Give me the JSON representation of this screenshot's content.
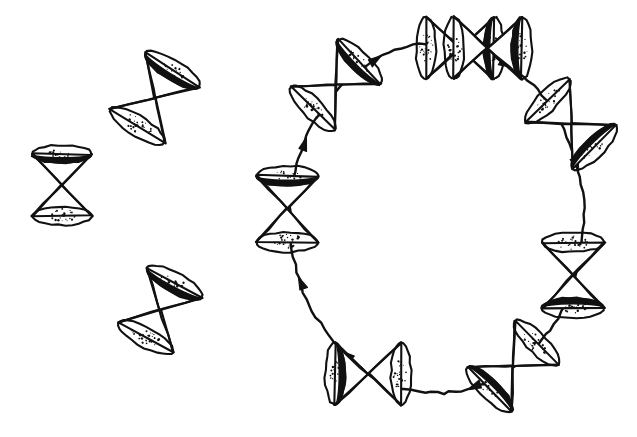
{
  "figure": {
    "title": "Light cones tipping over around a closed timelike curve",
    "medium": "hand-drawn ink line drawing",
    "background_color": "#ffffff",
    "ink_color": "#111111",
    "width": 637,
    "height": 437,
    "caption": ""
  },
  "chart_data": {
    "type": "diagram",
    "title": "Light cones tipping over around a closed timelike curve",
    "xlabel": "",
    "ylabel": "",
    "grid": false,
    "legend": "none",
    "xlim": [
      0,
      637
    ],
    "ylim": [
      0,
      437
    ],
    "ring": {
      "center_x": 437,
      "center_y": 218,
      "radius_x": 147,
      "radius_y": 175,
      "direction": "clockwise",
      "cone_count": 8,
      "arrow_count": 8,
      "rotation_per_step_deg": 45
    },
    "cones": [
      {
        "id": "free-cone-1",
        "label": "upright light cone",
        "cx": 62,
        "cy": 185,
        "rotation_deg": 0,
        "height": 62,
        "rim_rx": 30,
        "rim_ry": 9,
        "group": "isolated"
      },
      {
        "id": "free-cone-2",
        "label": "tilted light cone (upper)",
        "cx": 155,
        "cy": 98,
        "rotation_deg": 32,
        "height": 66,
        "rim_rx": 32,
        "rim_ry": 10,
        "group": "isolated"
      },
      {
        "id": "free-cone-3",
        "label": "tilted light cone (lower)",
        "cx": 160,
        "cy": 310,
        "rotation_deg": 28,
        "height": 62,
        "rim_rx": 31,
        "rim_ry": 10,
        "group": "isolated"
      },
      {
        "id": "ring-cone-1",
        "label": "ring cone at 12 o'clock",
        "cx": 460,
        "cy": 48,
        "rotation_deg": 90,
        "height": 68,
        "rim_rx": 31,
        "rim_ry": 10,
        "group": "ring",
        "angle_deg": -90
      },
      {
        "id": "ring-cone-2",
        "label": "ring cone at 1:30",
        "cx": 571,
        "cy": 124,
        "rotation_deg": 135,
        "height": 66,
        "rim_rx": 31,
        "rim_ry": 10,
        "group": "ring",
        "angle_deg": -45
      },
      {
        "id": "ring-cone-3",
        "label": "ring cone at 3 o'clock",
        "cx": 573,
        "cy": 275,
        "rotation_deg": 180,
        "height": 66,
        "rim_rx": 31,
        "rim_ry": 10,
        "group": "ring",
        "angle_deg": 0
      },
      {
        "id": "ring-cone-4",
        "label": "ring cone at 4:30",
        "cx": 513,
        "cy": 366,
        "rotation_deg": 225,
        "height": 66,
        "rim_rx": 31,
        "rim_ry": 10,
        "group": "ring",
        "angle_deg": 45
      },
      {
        "id": "ring-cone-5",
        "label": "ring cone at 6 o'clock",
        "cx": 368,
        "cy": 374,
        "rotation_deg": 270,
        "height": 66,
        "rim_rx": 31,
        "rim_ry": 10,
        "group": "ring",
        "angle_deg": 90
      },
      {
        "id": "ring-cone-6",
        "label": "ring cone at 9 o'clock",
        "cx": 287,
        "cy": 209,
        "rotation_deg": 0,
        "height": 66,
        "rim_rx": 31,
        "rim_ry": 10,
        "group": "ring",
        "angle_deg": 180
      },
      {
        "id": "ring-cone-7",
        "label": "ring cone at 10:30",
        "cx": 336,
        "cy": 85,
        "rotation_deg": 45,
        "height": 66,
        "rim_rx": 31,
        "rim_ry": 10,
        "group": "ring",
        "angle_deg": -135
      },
      {
        "id": "ring-cone-8",
        "label": "ring cone at 12:30",
        "cx": 460,
        "cy": 48,
        "rotation_deg": 90,
        "height": 68,
        "rim_rx": 31,
        "rim_ry": 10,
        "group": "ring",
        "angle_deg": -85
      }
    ],
    "arrows": [
      {
        "id": "arrow-1",
        "label": "clockwise arrow top-left",
        "at_angle_deg": -115,
        "points": "right"
      },
      {
        "id": "arrow-2",
        "label": "clockwise arrow top-right",
        "at_angle_deg": -62,
        "points": "down-right"
      },
      {
        "id": "arrow-3",
        "label": "clockwise arrow right-upper",
        "at_angle_deg": -18,
        "points": "down"
      },
      {
        "id": "arrow-4",
        "label": "clockwise arrow right-lower",
        "at_angle_deg": 28,
        "points": "down-left"
      },
      {
        "id": "arrow-5",
        "label": "clockwise arrow bottom",
        "at_angle_deg": 75,
        "points": "left"
      },
      {
        "id": "arrow-6",
        "label": "clockwise arrow bottom-left",
        "at_angle_deg": 128,
        "points": "up-left"
      },
      {
        "id": "arrow-7",
        "label": "clockwise arrow left-lower",
        "at_angle_deg": 158,
        "points": "up"
      },
      {
        "id": "arrow-8",
        "label": "clockwise arrow left-upper",
        "at_angle_deg": 205,
        "points": "up-right"
      }
    ]
  }
}
